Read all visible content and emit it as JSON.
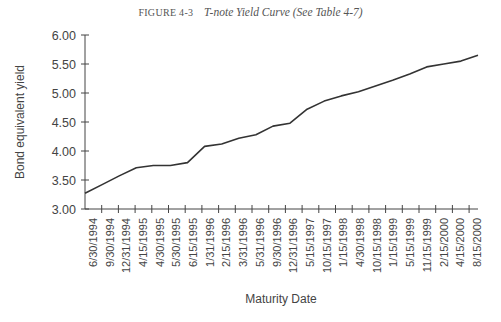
{
  "figure": {
    "number": "FIGURE 4-3",
    "caption": "T-note Yield Curve (See Table 4-7)"
  },
  "chart_data": {
    "type": "line",
    "title": "T-note Yield Curve (See Table 4-7)",
    "xlabel": "Maturity Date",
    "ylabel": "Bond equivalent yield",
    "ylim": [
      3.0,
      6.0
    ],
    "yticks": [
      "3.00",
      "3.50",
      "4.00",
      "4.50",
      "5.00",
      "5.50",
      "6.00"
    ],
    "grid": false,
    "legend": null,
    "categories": [
      "6/30/1994",
      "9/30/1994",
      "12/31/1994",
      "4/15/1995",
      "4/30/1995",
      "5/30/1995",
      "6/15/1995",
      "1/31/1996",
      "2/15/1996",
      "3/31/1996",
      "5/31/1996",
      "9/30/1996",
      "12/31/1996",
      "5/15/1997",
      "10/15/1997",
      "1/15/1998",
      "4/30/1998",
      "10/15/1998",
      "1/15/1999",
      "5/15/1999",
      "11/15/1999",
      "2/15/2000",
      "4/15/2000",
      "8/15/2000"
    ],
    "values": [
      3.27,
      3.42,
      3.57,
      3.71,
      3.75,
      3.75,
      3.8,
      4.08,
      4.12,
      4.22,
      4.28,
      4.43,
      4.48,
      4.72,
      4.86,
      4.95,
      5.02,
      5.12,
      5.22,
      5.33,
      5.45,
      5.5,
      5.55,
      5.65
    ],
    "line_color": "#333333"
  }
}
